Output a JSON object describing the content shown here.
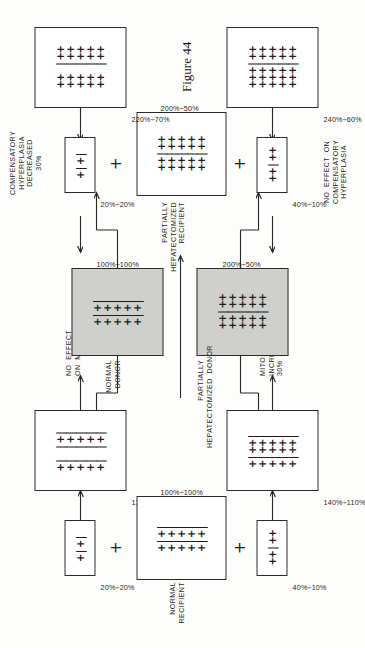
{
  "figure": {
    "caption": "Figure 44",
    "glyphs": {
      "plus": "+",
      "minus": "|",
      "join": "+"
    }
  },
  "nodes": {
    "normal_recipient": {
      "label": "NORMAL\nRECIPIENT",
      "ratio": "100%÷100%",
      "shaded": false,
      "rows": 5,
      "pattern": "+|+|"
    },
    "normal_donor": {
      "label": "NORMAL\nDONOR",
      "ratio": "100%÷100%",
      "shaded": true,
      "rows": 5,
      "pattern": "+|+|"
    },
    "ph_donor": {
      "label": "PARTIALLY\nHEPATECTOMIZED  DONOR",
      "ratio": "200%÷50%",
      "shaded": true,
      "rows": 5,
      "pattern": "++|++"
    },
    "ph_recipient": {
      "label": "PARTIALLY\nHEPATECTOMIZED\nRECIPIENT",
      "ratio": "200%÷50%",
      "shaded": false,
      "rows": 5,
      "pattern": "++|++"
    },
    "bar_tl": {
      "label": "",
      "ratio": "20%÷20%",
      "shaded": false,
      "rows": 1,
      "pattern": "+|+|"
    },
    "bar_tr": {
      "label": "",
      "ratio": "20%÷20%",
      "shaded": false,
      "rows": 1,
      "pattern": "+|+|"
    },
    "bar_bl": {
      "label": "",
      "ratio": "40%÷10%",
      "shaded": false,
      "rows": 1,
      "pattern": "++|++"
    },
    "bar_br": {
      "label": "",
      "ratio": "40%÷10%",
      "shaded": false,
      "rows": 1,
      "pattern": "++|++"
    },
    "result_tl": {
      "label": "",
      "ratio": "120%÷120%",
      "shaded": false,
      "rows": 5,
      "pattern": "+| |+|"
    },
    "result_tr": {
      "label": "",
      "ratio": "220%÷70%",
      "shaded": false,
      "rows": 5,
      "pattern": "++ |++"
    },
    "result_bl": {
      "label": "",
      "ratio": "140%÷110%",
      "shaded": false,
      "rows": 5,
      "pattern": "+|++|"
    },
    "result_br": {
      "label": "",
      "ratio": "240%÷60%",
      "shaded": false,
      "rows": 5,
      "pattern": "+++|++"
    }
  },
  "outcomes": {
    "top_left": "NO  EFFECT\nON  MITOSES",
    "top_right": "COMPENSATORY\nHYPERPLASIA\nDECREASED\n30%",
    "bottom_left": "MITOSES\nINCREASED\n30%",
    "bottom_right": "NO  EFFECT  ON\nCOMPENSATORY\nHYPERPLASIA"
  },
  "colors": {
    "ink": "#1d1d1d",
    "shade": "#cfcfcb",
    "paper": "#fdfdfb"
  }
}
